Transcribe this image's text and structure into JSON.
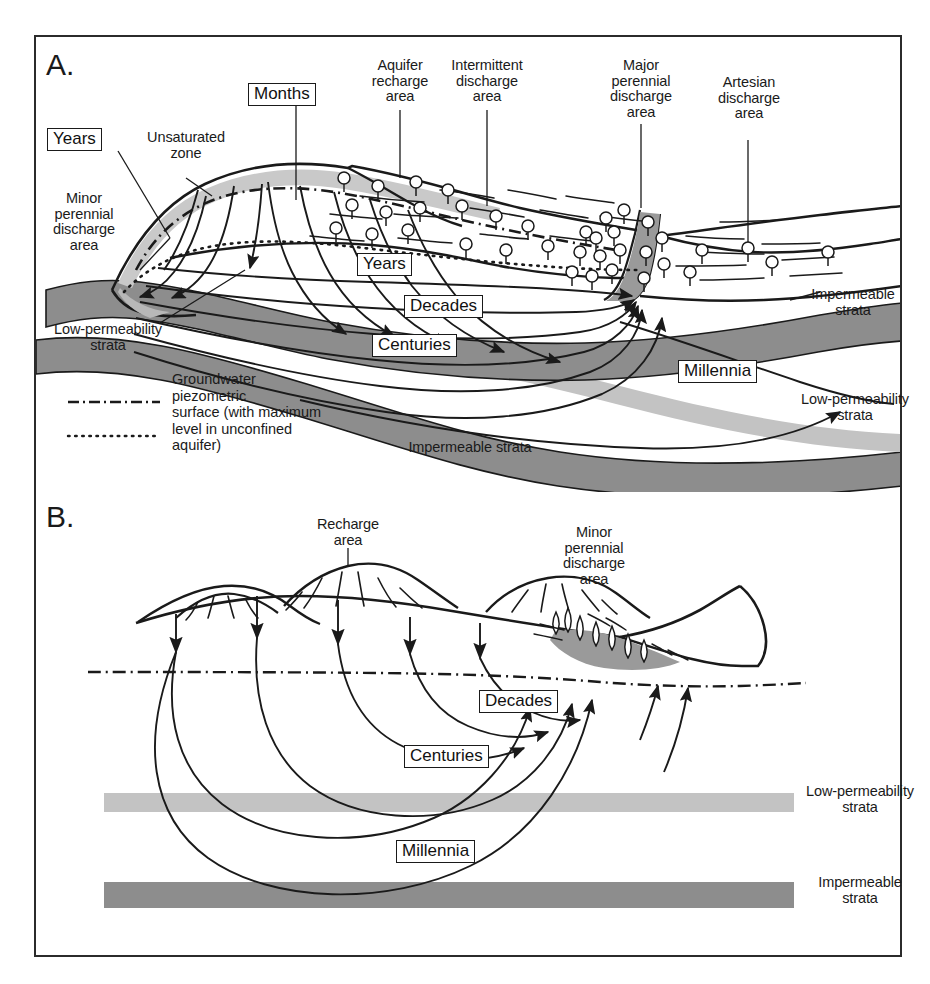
{
  "figure": {
    "panels": [
      {
        "id": "A",
        "letter": "A."
      },
      {
        "id": "B",
        "letter": "B."
      }
    ]
  },
  "panel_a": {
    "letter": "A.",
    "labels": {
      "unsaturated_zone": "Unsaturated\nzone",
      "minor_perennial": "Minor\nperennial\ndischarge\narea",
      "aquifer_recharge": "Aquifer\nrecharge\narea",
      "intermittent_discharge": "Intermittent\ndischarge\narea",
      "major_perennial": "Major\nperennial\ndischarge\narea",
      "artesian_discharge": "Artesian\ndischarge\narea",
      "impermeable_right": "Impermeable\nstrata",
      "impermeable_mid": "Impermeable strata",
      "low_perm_left": "Low-permeability\nstrata",
      "low_perm_right": "Low-permeability\nstrata"
    },
    "time_boxes": {
      "years_top": "Years",
      "months": "Months",
      "years_mid": "Years",
      "decades": "Decades",
      "centuries": "Centuries",
      "millennia": "Millennia"
    }
  },
  "legend": {
    "piezometric_text": "Groundwater\npiezometric\nsurface (with maximum\nlevel in unconfined\naquifer)",
    "dash_dot_style": "dash-dot",
    "dotted_style": "dotted"
  },
  "panel_b": {
    "letter": "B.",
    "labels": {
      "recharge_area": "Recharge\narea",
      "minor_perennial": "Minor\nperennial\ndischarge\narea",
      "low_perm": "Low-permeability\nstrata",
      "impermeable": "Impermeable\nstrata"
    },
    "time_boxes": {
      "decades": "Decades",
      "centuries": "Centuries",
      "millennia": "Millennia"
    }
  },
  "colors": {
    "impermeable_strata": "#8d8d8d",
    "low_permeability_strata": "#c3c3c3",
    "unsaturated_zone": "#c9c9c9",
    "wetland_fill": "#9a9a9a",
    "line": "#1a1a1a",
    "frame": "#2b2b2b",
    "background": "#ffffff"
  }
}
